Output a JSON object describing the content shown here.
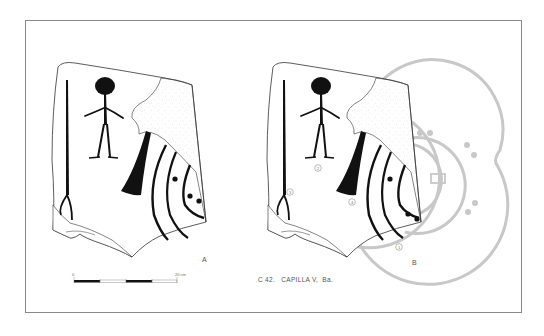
{
  "figure": {
    "caption": "C 42.   CAPILLA V,  Ba.",
    "panel_a_label": "A",
    "panel_b_label": "B",
    "scale": {
      "start_label": "0",
      "end_label": "20 cm",
      "segments": [
        "black",
        "white",
        "black",
        "white"
      ]
    },
    "motif_numbers": [
      "1",
      "2",
      "3",
      "4"
    ],
    "colors": {
      "ink": "#111111",
      "outline": "#333333",
      "reconstruction": "#c8c8c8",
      "frame": "#8a8a8a",
      "stipple": "#9a9a9a"
    }
  }
}
